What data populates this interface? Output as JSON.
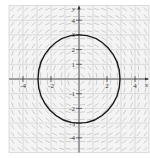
{
  "chart_data": {
    "type": "scatter",
    "subtype": "slope-field-with-solution-curve",
    "title": "",
    "xlabel": "x",
    "ylabel": "y",
    "xlim": [
      -5,
      5
    ],
    "ylim": [
      -5,
      5
    ],
    "grid": true,
    "x_ticks": [
      -4,
      -2,
      2,
      4
    ],
    "y_ticks": [
      -4,
      -3,
      -2,
      -1,
      1,
      2,
      3,
      4
    ],
    "x_tick_labels": [
      "-4",
      "-2",
      "2",
      "4"
    ],
    "y_tick_labels": [
      "-4",
      "-3",
      "-2",
      "-1",
      "1",
      "2",
      "3",
      "4"
    ],
    "slope_field": {
      "equation": "dy/dx = -x/y",
      "spacing": 0.5
    },
    "curves": [
      {
        "name": "solution circle",
        "equation": "x^2 + y^2 = 9",
        "center": [
          0,
          0
        ],
        "radius": 3,
        "color": "#1a1a1a"
      }
    ],
    "colors": {
      "grid": "#c8c8c8",
      "axes": "#333333",
      "slope_segments": "#b0b0b0",
      "curve": "#1a1a1a"
    }
  }
}
